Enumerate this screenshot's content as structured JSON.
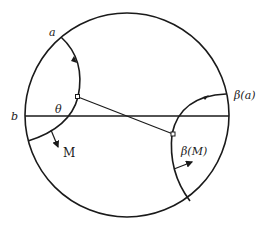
{
  "figure": {
    "labels": {
      "point_a": "a",
      "point_b": "b",
      "angle": "θ",
      "geodesic_M": "M",
      "point_beta_a": "β(a)",
      "geodesic_beta_M": "β(M)"
    },
    "elements": [
      {
        "name": "boundary-circle",
        "kind": "circle"
      },
      {
        "name": "horizontal-diameter",
        "kind": "line"
      },
      {
        "name": "geodesic-M",
        "kind": "arc",
        "orientation_arrow": "downward"
      },
      {
        "name": "geodesic-beta-M",
        "kind": "arc",
        "orientation_arrow": "upward-left"
      },
      {
        "name": "common-perpendicular",
        "kind": "line-segment",
        "right_angle_markers": 2
      },
      {
        "name": "normal-arrow-M",
        "kind": "arrow"
      },
      {
        "name": "normal-arrow-beta-M",
        "kind": "arrow"
      }
    ]
  }
}
